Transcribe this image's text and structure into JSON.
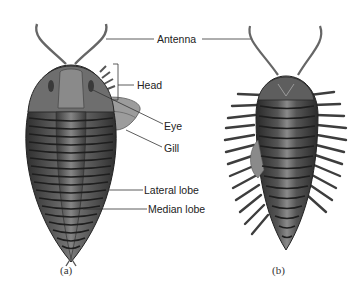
{
  "figure": {
    "panels": [
      {
        "id": "a",
        "caption": "(a)",
        "view": "dorsal"
      },
      {
        "id": "b",
        "caption": "(b)",
        "view": "ventral"
      }
    ],
    "labels": {
      "antenna": "Antenna",
      "head": "Head",
      "eye": "Eye",
      "gill": "Gill",
      "lateral_lobe": "Lateral lobe",
      "median_lobe": "Median lobe"
    },
    "colors": {
      "body_dark": "#3a3a3a",
      "body_mid": "#6b6b6b",
      "body_light": "#9a9a9a",
      "line": "#444444"
    }
  }
}
